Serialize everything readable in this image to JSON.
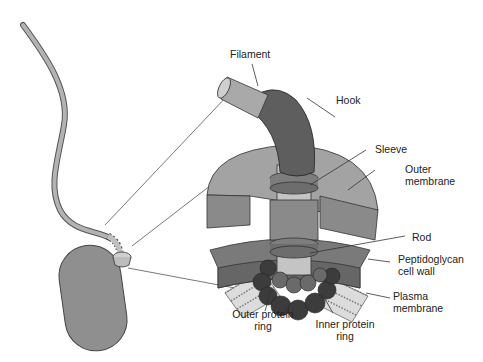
{
  "labels": {
    "filament": "Filament",
    "hook": "Hook",
    "sleeve": "Sleeve",
    "outer_membrane_1": "Outer",
    "outer_membrane_2": "membrane",
    "rod": "Rod",
    "peptidoglycan_1": "Peptidoglycan",
    "peptidoglycan_2": "cell wall",
    "plasma_1": "Plasma",
    "plasma_2": "membrane",
    "outer_ring_1": "Outer protein",
    "outer_ring_2": "ring",
    "inner_ring_1": "Inner protein",
    "inner_ring_2": "ring"
  },
  "colors": {
    "filament": "#a9a9a9",
    "hook": "#5e5e5e",
    "outer_membrane": "#a3a3a3",
    "outer_membrane_side": "#8a8a8a",
    "peptidoglycan": "#767676",
    "rod": "#c4c4c4",
    "sleeve": "#7d7d7d",
    "rings_dark": "#3c3c3c",
    "rings_mid": "#6a6a6a",
    "cell": "#8f8f8f",
    "line": "#333333"
  }
}
